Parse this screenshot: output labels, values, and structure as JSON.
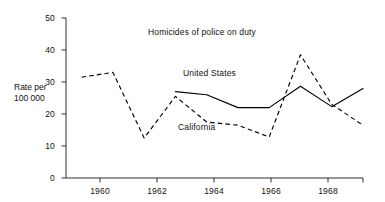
{
  "chart_data": {
    "type": "line",
    "title": "Homicides of police on duty",
    "xlabel": "",
    "ylabel": "Rate per 100 000",
    "ylabel_line1": "Rate per",
    "ylabel_line2": "100 000",
    "xlim": [
      1959.5,
      1969.0
    ],
    "ylim": [
      0,
      50
    ],
    "yticks": [
      0,
      10,
      20,
      30,
      40,
      50
    ],
    "ytick_labels": [
      "0",
      "10",
      "20",
      "30",
      "40",
      "50"
    ],
    "xticks": [
      1960,
      1962,
      1964,
      1966,
      1968
    ],
    "xtick_labels": [
      "1960",
      "1962",
      "1964",
      "1966",
      "1968"
    ],
    "grid": false,
    "legend": "inline-annotations",
    "x": [
      1960,
      1961,
      1962,
      1963,
      1964,
      1965,
      1966,
      1967,
      1968,
      1969
    ],
    "series": [
      {
        "name": "United States",
        "style": "solid",
        "color": "#000000",
        "x": [
          1963,
          1964,
          1965,
          1966,
          1967,
          1968,
          1969
        ],
        "values": [
          27.0,
          26.0,
          22.0,
          22.0,
          28.7,
          22.3,
          28.0
        ]
      },
      {
        "name": "California",
        "style": "dashed",
        "color": "#000000",
        "x": [
          1960,
          1961,
          1962,
          1963,
          1964,
          1965,
          1966,
          1967,
          1968,
          1969
        ],
        "values": [
          31.5,
          33.0,
          12.5,
          25.5,
          17.5,
          16.5,
          12.8,
          38.5,
          23.0,
          16.5
        ]
      }
    ],
    "annotations": [
      {
        "text": "United States",
        "x": 1964.2,
        "y": 31.0
      },
      {
        "text": "California",
        "x": 1964.0,
        "y": 15.0
      }
    ]
  },
  "axis": {
    "line_color": "#000000",
    "tick_color": "#000000"
  }
}
